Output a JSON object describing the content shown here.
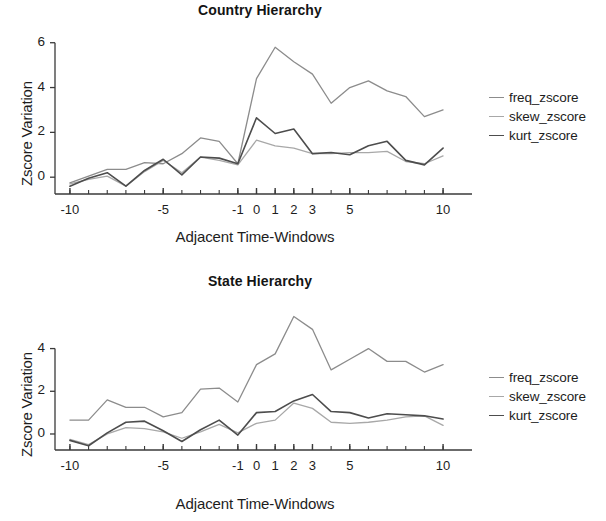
{
  "figure": {
    "width": 606,
    "height": 521
  },
  "colors": {
    "freq": "#8c8c8c",
    "skew": "#a8a8a8",
    "kurt": "#4d4d4d",
    "axis": "#3a3a3a",
    "text": "#1d1d1d",
    "background": "#ffffff"
  },
  "legend": {
    "position": "right",
    "entries": [
      {
        "label": "freq_zscore",
        "color": "#8c8c8c"
      },
      {
        "label": "skew_zscore",
        "color": "#a8a8a8"
      },
      {
        "label": "kurt_zscore",
        "color": "#4d4d4d"
      }
    ]
  },
  "chart_data": [
    {
      "type": "line",
      "title": "Country Hierarchy",
      "xlabel": "Adjacent Time-Windows",
      "ylabel": "Zscore Variation",
      "grid": false,
      "legend_position": "right",
      "x": [
        -10,
        -9,
        -8,
        -7,
        -6,
        -5,
        -4,
        -3,
        -2,
        -1,
        0,
        1,
        2,
        3,
        4,
        5,
        6,
        7,
        8,
        9,
        10
      ],
      "xticks": [
        -10,
        -5,
        -1,
        0,
        1,
        2,
        3,
        5,
        10
      ],
      "xticklabels": [
        "-10",
        "-5",
        "-1",
        "0",
        "1",
        "2",
        "3",
        "5",
        "10"
      ],
      "xlim": [
        -10.8,
        10.8
      ],
      "yticks": [
        0,
        2,
        4,
        6
      ],
      "yticklabels": [
        "0",
        "2",
        "4",
        "6"
      ],
      "ylim": [
        -0.75,
        6.3
      ],
      "series": [
        {
          "name": "freq_zscore",
          "color": "#8c8c8c",
          "values": [
            -0.25,
            0.05,
            0.35,
            0.35,
            0.65,
            0.6,
            1.05,
            1.75,
            1.6,
            0.6,
            4.4,
            5.8,
            5.15,
            4.6,
            3.3,
            4.0,
            4.3,
            3.85,
            3.6,
            2.7,
            3.0
          ]
        },
        {
          "name": "skew_zscore",
          "color": "#a8a8a8",
          "values": [
            -0.3,
            -0.1,
            0.05,
            -0.4,
            0.25,
            0.75,
            0.2,
            0.9,
            0.75,
            0.55,
            1.65,
            1.4,
            1.3,
            1.05,
            1.05,
            1.1,
            1.1,
            1.15,
            0.7,
            0.6,
            0.95
          ]
        },
        {
          "name": "kurt_zscore",
          "color": "#4d4d4d",
          "values": [
            -0.4,
            -0.05,
            0.2,
            -0.4,
            0.3,
            0.8,
            0.1,
            0.9,
            0.85,
            0.6,
            2.65,
            1.95,
            2.15,
            1.05,
            1.1,
            1.0,
            1.4,
            1.6,
            0.75,
            0.55,
            1.3
          ]
        }
      ]
    },
    {
      "type": "line",
      "title": "State Hierarchy",
      "xlabel": "Adjacent Time-Windows",
      "ylabel": "Zscore Variation",
      "grid": false,
      "legend_position": "right",
      "x": [
        -10,
        -9,
        -8,
        -7,
        -6,
        -5,
        -4,
        -3,
        -2,
        -1,
        0,
        1,
        2,
        3,
        4,
        5,
        6,
        7,
        8,
        9,
        10
      ],
      "xticks": [
        -10,
        -5,
        -1,
        0,
        1,
        2,
        3,
        5,
        10
      ],
      "xticklabels": [
        "-10",
        "-5",
        "-1",
        "0",
        "1",
        "2",
        "3",
        "5",
        "10"
      ],
      "xlim": [
        -10.8,
        10.8
      ],
      "yticks": [
        0,
        2,
        4
      ],
      "yticklabels": [
        "0",
        "2",
        "4"
      ],
      "ylim": [
        -0.75,
        5.9
      ],
      "series": [
        {
          "name": "freq_zscore",
          "color": "#8c8c8c",
          "values": [
            0.65,
            0.65,
            1.6,
            1.25,
            1.25,
            0.8,
            1.0,
            2.1,
            2.15,
            1.5,
            3.25,
            3.75,
            5.5,
            4.9,
            3.0,
            3.5,
            4.0,
            3.4,
            3.4,
            2.9,
            3.25
          ]
        },
        {
          "name": "skew_zscore",
          "color": "#a8a8a8",
          "values": [
            -0.25,
            -0.5,
            0.0,
            0.3,
            0.25,
            0.1,
            -0.2,
            0.1,
            0.45,
            0.05,
            0.5,
            0.65,
            1.45,
            1.2,
            0.55,
            0.5,
            0.55,
            0.65,
            0.8,
            0.85,
            0.4
          ]
        },
        {
          "name": "kurt_zscore",
          "color": "#4d4d4d",
          "values": [
            -0.3,
            -0.55,
            0.05,
            0.55,
            0.6,
            0.15,
            -0.35,
            0.2,
            0.65,
            -0.05,
            1.0,
            1.05,
            1.55,
            1.85,
            1.05,
            1.0,
            0.75,
            0.95,
            0.9,
            0.85,
            0.7
          ]
        }
      ]
    }
  ]
}
